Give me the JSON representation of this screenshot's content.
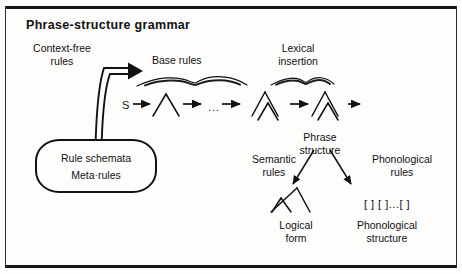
{
  "figure": {
    "title": "Phrase-structure grammar",
    "accent_color": "#111111",
    "background_color": "#fdfdfc"
  },
  "labels": {
    "context_free_rules": "Context-free\nrules",
    "context_free_rules_line1": "Context-free",
    "context_free_rules_line2": "rules",
    "base_rules": "Base rules",
    "lexical_insertion_line1": "Lexical",
    "lexical_insertion_line2": "insertion",
    "start_symbol": "S",
    "ellipsis": "...",
    "phrase_structure_line1": "Phrase",
    "phrase_structure_line2": "structure",
    "semantic_rules_line1": "Semantic",
    "semantic_rules_line2": "rules",
    "phonological_rules_line1": "Phonological",
    "phonological_rules_line2": "rules",
    "logical_form_line1": "Logical",
    "logical_form_line2": "form",
    "phonological_structure_line1": "Phonological",
    "phonological_structure_line2": "structure",
    "phonological_brackets": "[ ] [ ]...[ ]"
  },
  "rule_box": {
    "line1": "Rule schemata",
    "line2": "Meta·rules"
  },
  "nodes": [
    {
      "id": "context-free-rules",
      "type": "text-label",
      "label": "Context-free rules"
    },
    {
      "id": "rule-schemata-box",
      "type": "rounded-box",
      "label": "Rule schemata / Meta·rules"
    },
    {
      "id": "base-rules",
      "type": "stage-label",
      "label": "Base rules"
    },
    {
      "id": "lexical-insertion",
      "type": "stage-label",
      "label": "Lexical insertion"
    },
    {
      "id": "phrase-structure",
      "type": "stage-label",
      "label": "Phrase structure"
    },
    {
      "id": "semantic-rules",
      "type": "stage-label",
      "label": "Semantic rules"
    },
    {
      "id": "phonological-rules",
      "type": "stage-label",
      "label": "Phonological rules"
    },
    {
      "id": "logical-form",
      "type": "output-label",
      "label": "Logical form"
    },
    {
      "id": "phonological-structure",
      "type": "output-label",
      "label": "Phonological structure"
    }
  ],
  "derivation_steps": [
    {
      "index": 0,
      "glyph": "S",
      "kind": "symbol"
    },
    {
      "index": 1,
      "glyph": "tree-simple",
      "kind": "tree"
    },
    {
      "index": 2,
      "glyph": "...",
      "kind": "ellipsis"
    },
    {
      "index": 3,
      "glyph": "tree-expanded",
      "kind": "tree"
    },
    {
      "index": 4,
      "glyph": "tree-expanded",
      "kind": "tree"
    }
  ]
}
